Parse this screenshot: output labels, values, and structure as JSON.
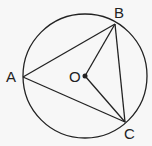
{
  "diagram": {
    "type": "circle-inscribed-triangle",
    "circle": {
      "center": "O",
      "cx": 85,
      "cy": 76,
      "r": 62
    },
    "points": {
      "A": {
        "label": "A",
        "x": 23,
        "y": 77
      },
      "B": {
        "label": "B",
        "x": 115,
        "y": 24
      },
      "C": {
        "label": "C",
        "x": 125,
        "y": 122
      },
      "O": {
        "label": "O",
        "x": 85,
        "y": 76
      }
    },
    "segments": [
      "AB",
      "BC",
      "CA",
      "OB",
      "OC"
    ],
    "colors": {
      "stroke": "#222222",
      "background": "#f7f7f7"
    }
  }
}
